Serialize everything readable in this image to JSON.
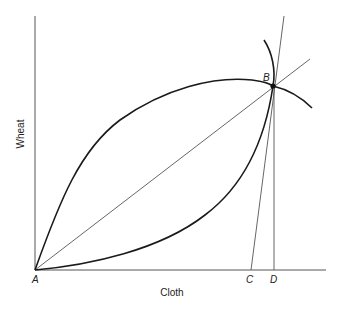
{
  "diagram": {
    "type": "economics-trade-diagram",
    "axes": {
      "x_label": "Cloth",
      "y_label": "Wheat"
    },
    "points": {
      "A": "A",
      "B": "B",
      "C": "C",
      "D": "D"
    },
    "elements": [
      {
        "name": "upper-concave-curve",
        "from": "A",
        "through": "B",
        "description": "curve bowed upward from A to B, continuing beyond B"
      },
      {
        "name": "lower-convex-curve",
        "from": "A",
        "through": "B",
        "description": "curve bowed downward from A to B, continuing beyond B"
      },
      {
        "name": "diagonal-ray",
        "from": "A",
        "through": "B"
      },
      {
        "name": "steep-line",
        "from": "C",
        "through": "B"
      },
      {
        "name": "vertical-line",
        "from": "D",
        "to": "B"
      }
    ],
    "colors": {
      "line": "#1a1a1a",
      "thin_line": "#555555",
      "background": "#ffffff"
    }
  }
}
